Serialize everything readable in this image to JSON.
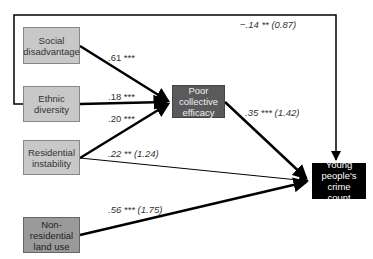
{
  "nodes": {
    "social": "Social disadvantage",
    "ethnic": "Ethnic diversity",
    "residential": "Residential instability",
    "nonres": "Non-residential land use",
    "efficacy": "Poor collective efficacy",
    "crime": "Young people's crime count"
  },
  "paths": {
    "social_efficacy": ".61 ***",
    "ethnic_efficacy": ".18 ***",
    "residential_efficacy": ".20 ***",
    "efficacy_crime": ".35 *** (1.42)",
    "residential_crime": ".22 ** (1.24)",
    "nonres_crime": ".56 *** (1.75)",
    "ethnic_crime": "−.14 ** (0.87)"
  },
  "colors": {
    "light_box": "#c8c8c8",
    "mid_box": "#9a9a9a",
    "efficacy_box": "#5a5a5a",
    "crime_box": "#000000"
  }
}
